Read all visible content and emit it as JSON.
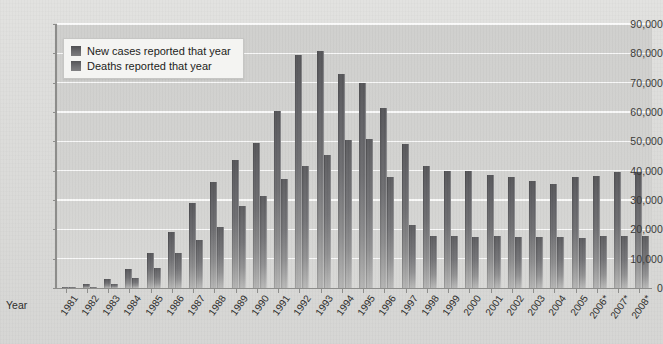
{
  "chart_data": {
    "type": "bar",
    "title": "",
    "xlabel": "Year",
    "ylabel": "",
    "ylim": [
      0,
      90000
    ],
    "ytick_step": 10000,
    "grid": true,
    "legend_position": "top-left",
    "yticks": [
      "0",
      "10,000",
      "20,000",
      "30,000",
      "40,000",
      "50,000",
      "60,000",
      "70,000",
      "80,000",
      "90,000"
    ],
    "categories": [
      "1981",
      "1982",
      "1983",
      "1984",
      "1985",
      "1986",
      "1987",
      "1988",
      "1989",
      "1990",
      "1991",
      "1992",
      "1993",
      "1994",
      "1995",
      "1996",
      "1997",
      "1998",
      "1999",
      "2000",
      "2001",
      "2002",
      "2003",
      "2004",
      "2005",
      "2006*",
      "2007*",
      "2008*"
    ],
    "series": [
      {
        "name": "New cases reported that year",
        "color": "#6a6a6d",
        "values": [
          300,
          1200,
          3100,
          6400,
          12000,
          19100,
          29000,
          36000,
          43500,
          49500,
          60500,
          79500,
          80800,
          72800,
          69800,
          61300,
          49000,
          41600,
          39800,
          39900,
          38600,
          38000,
          36500,
          35400,
          38000,
          38200,
          39500,
          39400
        ]
      },
      {
        "name": "Deaths reported that year",
        "color": "#74747a",
        "values": [
          120,
          450,
          1400,
          3400,
          6800,
          12000,
          16200,
          20900,
          27800,
          31500,
          37000,
          41500,
          45500,
          50500,
          50800,
          38000,
          21400,
          17900,
          17700,
          17400,
          17600,
          17300,
          17400,
          17500,
          17000,
          17800,
          17600,
          17900
        ]
      }
    ]
  },
  "legend": {
    "items": [
      {
        "label": "New cases reported that year"
      },
      {
        "label": "Deaths reported that year"
      }
    ]
  },
  "axis": {
    "year_label": "Year"
  }
}
